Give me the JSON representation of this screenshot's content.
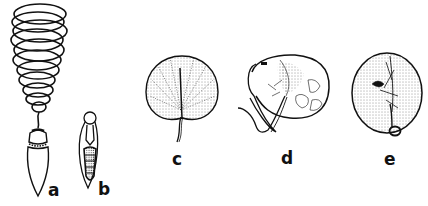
{
  "figure": {
    "panels": [
      {
        "id": "a",
        "label": "a",
        "label_pos": [
          48,
          182
        ]
      },
      {
        "id": "b",
        "label": "b",
        "label_pos": [
          98,
          181
        ]
      },
      {
        "id": "c",
        "label": "c",
        "label_pos": [
          172,
          151
        ]
      },
      {
        "id": "d",
        "label": "d",
        "label_pos": [
          281,
          150
        ]
      },
      {
        "id": "e",
        "label": "e",
        "label_pos": [
          384,
          151
        ]
      }
    ]
  },
  "colors": {
    "ink": "#111111",
    "background": "#ffffff"
  }
}
